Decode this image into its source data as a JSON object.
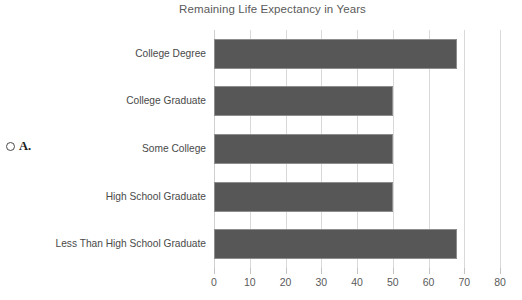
{
  "marker": {
    "radio_icon": "radio-unselected-icon",
    "letter": "A."
  },
  "chart_data": {
    "type": "bar",
    "orientation": "horizontal",
    "title": "Remaining Life Expectancy in Years",
    "xlabel": "",
    "ylabel": "",
    "categories": [
      "College Degree",
      "College Graduate",
      "Some College",
      "High School Graduate",
      "Less Than High School Graduate"
    ],
    "values": [
      68,
      50,
      50,
      50,
      68
    ],
    "xlim": [
      0,
      80
    ],
    "xticks": [
      0,
      10,
      20,
      30,
      40,
      50,
      60,
      70,
      80
    ],
    "xtick_labels": [
      "0",
      "10",
      "20",
      "30",
      "40",
      "50",
      "60",
      "70",
      "80"
    ],
    "grid": "vertical",
    "legend": "none",
    "bar_color": "#575757",
    "bar_border_color": "#8d8d8d",
    "gridline_color": "#d9d9d9",
    "title_color": "#5a5a5a",
    "label_color": "#4a4a4a"
  }
}
